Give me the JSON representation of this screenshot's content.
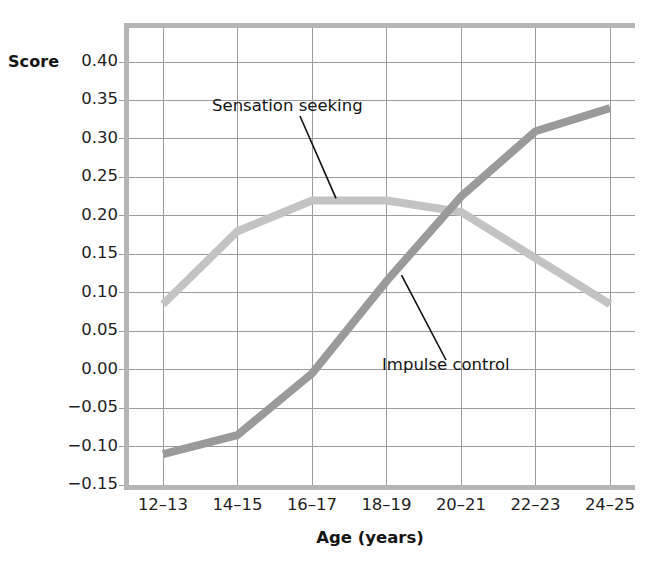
{
  "chart_data": {
    "type": "line",
    "title": "",
    "xlabel": "Age (years)",
    "ylabel": "Score",
    "categories": [
      "12–13",
      "14–15",
      "16–17",
      "18–19",
      "20–21",
      "22–23",
      "24–25"
    ],
    "ytick_labels": [
      "0.40",
      "0.35",
      "0.30",
      "0.25",
      "0.20",
      "0.15",
      "0.10",
      "0.05",
      "0.00",
      "−0.05",
      "−0.10",
      "−0.15"
    ],
    "ytick_values": [
      0.4,
      0.35,
      0.3,
      0.25,
      0.2,
      0.15,
      0.1,
      0.05,
      0.0,
      -0.05,
      -0.1,
      -0.15
    ],
    "ylim": [
      -0.15,
      0.425
    ],
    "grid": true,
    "legend_position": "inline-annotations",
    "series": [
      {
        "name": "Sensation seeking",
        "color": "#c3c3c3",
        "values": [
          0.085,
          0.18,
          0.22,
          0.22,
          0.205,
          0.145,
          0.085
        ]
      },
      {
        "name": "Impulse control",
        "color": "#9a9a9a",
        "values": [
          -0.11,
          -0.085,
          -0.005,
          0.115,
          0.225,
          0.31,
          0.34
        ]
      }
    ],
    "annotations": [
      {
        "text": "Sensation seeking",
        "points_to_series": "Sensation seeking",
        "points_to_category": "16–17"
      },
      {
        "text": "Impulse control",
        "points_to_series": "Impulse control",
        "points_to_category": "18–19"
      }
    ]
  },
  "axes": {
    "y_title": "Score",
    "x_title": "Age (years)"
  },
  "colors": {
    "sensation_seeking": "#c3c3c3",
    "impulse_control": "#9a9a9a",
    "grid": "#9c9c9c",
    "frame": "#b5b5b5",
    "text": "#1a1a1a",
    "background": "#ffffff"
  }
}
